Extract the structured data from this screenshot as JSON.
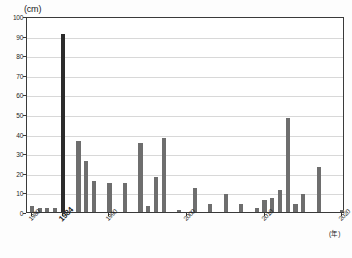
{
  "chart_data": {
    "type": "bar",
    "title": "",
    "subtitle": "",
    "xlabel": "(年)",
    "ylabel": "(cm)",
    "ylim": [
      0,
      100
    ],
    "xlim": [
      1980,
      2020
    ],
    "grid": true,
    "legend": null,
    "y_ticks": [
      0,
      10,
      20,
      30,
      40,
      50,
      60,
      70,
      80,
      90,
      100
    ],
    "x_ticks": [
      1980,
      1984,
      1990,
      2000,
      2010,
      2020
    ],
    "highlight_year": 1984,
    "highlight_color": "#2b2b2b",
    "bar_color": "#6e6e6e",
    "categories": [
      1980,
      1981,
      1982,
      1983,
      1984,
      1985,
      1986,
      1987,
      1988,
      1989,
      1990,
      1991,
      1992,
      1993,
      1994,
      1995,
      1996,
      1997,
      1998,
      1999,
      2000,
      2001,
      2002,
      2003,
      2004,
      2005,
      2006,
      2007,
      2008,
      2009,
      2010,
      2011,
      2012,
      2013,
      2014,
      2015,
      2016,
      2017,
      2018,
      2019,
      2020
    ],
    "values": [
      3,
      2,
      2,
      2,
      91,
      0,
      36,
      26,
      16,
      0,
      15,
      0,
      15,
      0,
      35,
      3,
      18,
      38,
      0,
      1,
      0,
      12,
      0,
      4,
      0,
      9,
      0,
      4,
      0,
      2,
      6,
      7,
      11,
      48,
      4,
      9,
      0,
      23,
      0,
      0,
      1
    ]
  }
}
